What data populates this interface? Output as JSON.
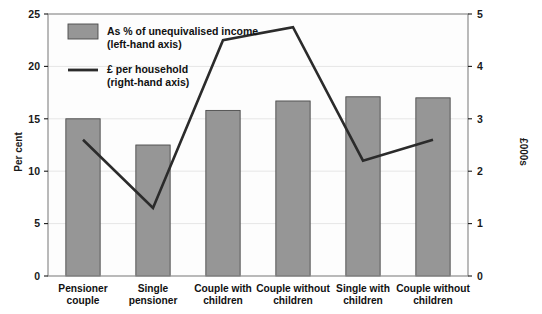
{
  "chart_data": {
    "type": "bar",
    "title": "",
    "subtitle": "",
    "categories": [
      "Pensioner couple",
      "Single pensioner",
      "Couple with children",
      "Couple without children",
      "Single with children",
      "Couple without children"
    ],
    "category_lines": [
      [
        "Pensioner",
        "couple"
      ],
      [
        "Single",
        "pensioner"
      ],
      [
        "Couple with",
        "children"
      ],
      [
        "Couple without",
        "children"
      ],
      [
        "Single with",
        "children"
      ],
      [
        "Couple without",
        "children"
      ]
    ],
    "series": [
      {
        "name": "As % of unequivalised income (left-hand axis)",
        "short_name": "As % of unequivalised income",
        "axis": "left",
        "render": "bar",
        "color": "#969696",
        "values": [
          15.0,
          12.5,
          15.8,
          16.7,
          17.1,
          17.0
        ]
      },
      {
        "name": "£ per household (right-hand axis)",
        "short_name": "£ per household",
        "axis": "right",
        "render": "line",
        "color": "#2b2b2b",
        "values": [
          2.6,
          1.3,
          4.5,
          4.75,
          2.2,
          2.6
        ]
      }
    ],
    "xlabel": "",
    "ylabel": "Per cent",
    "ylabel_right": "£000s",
    "ylim": [
      0,
      25
    ],
    "ylim_right": [
      0,
      5
    ],
    "yticks": [
      0,
      5,
      10,
      15,
      20,
      25
    ],
    "yticks_right": [
      0,
      1,
      2,
      3,
      4,
      5
    ],
    "ytick_labels": [
      "0",
      "5",
      "10",
      "15",
      "20",
      "25"
    ],
    "ytick_labels_right": [
      "0",
      "1",
      "2",
      "3",
      "4",
      "5"
    ],
    "grid": true,
    "grid_axis": "y",
    "legend_position": "top-left",
    "legend": [
      {
        "marker": "swatch",
        "color": "#969696",
        "line1": "As % of unequivalised income",
        "line2": "(left-hand axis)"
      },
      {
        "marker": "line",
        "color": "#2b2b2b",
        "line1": "£ per household",
        "line2": "(right-hand axis)"
      }
    ]
  },
  "axes": {
    "left_title": "Per cent",
    "right_title": "£000s"
  }
}
